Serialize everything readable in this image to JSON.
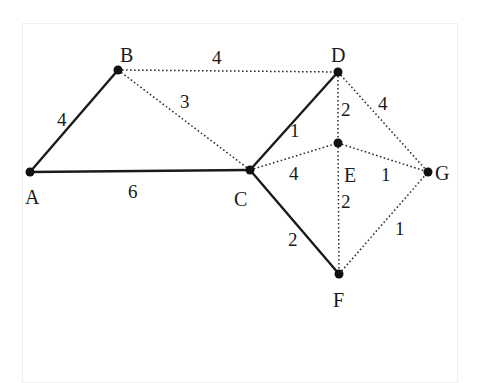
{
  "diagram": {
    "type": "weighted-undirected-graph",
    "style": {
      "background": "#ffffff",
      "frame_border": "#efefef",
      "ink": "#1a1a1a"
    },
    "nodes": [
      {
        "id": "A",
        "label": "A",
        "x": 30,
        "y": 172,
        "label_x": 25,
        "label_y": 204
      },
      {
        "id": "B",
        "label": "B",
        "x": 118,
        "y": 70,
        "label_x": 120,
        "label_y": 62
      },
      {
        "id": "C",
        "label": "C",
        "x": 250,
        "y": 170,
        "label_x": 234,
        "label_y": 206
      },
      {
        "id": "D",
        "label": "D",
        "x": 338,
        "y": 72,
        "label_x": 331,
        "label_y": 62
      },
      {
        "id": "E",
        "label": "E",
        "x": 338,
        "y": 143,
        "label_x": 344,
        "label_y": 182
      },
      {
        "id": "F",
        "label": "F",
        "x": 339,
        "y": 274,
        "label_x": 333,
        "label_y": 307
      },
      {
        "id": "G",
        "label": "G",
        "x": 428,
        "y": 172,
        "label_x": 435,
        "label_y": 180
      }
    ],
    "edges": [
      {
        "from": "A",
        "to": "B",
        "weight": "4",
        "style": "solid",
        "label_x": 57,
        "label_y": 126
      },
      {
        "from": "A",
        "to": "C",
        "weight": "6",
        "style": "solid",
        "label_x": 128,
        "label_y": 198
      },
      {
        "from": "C",
        "to": "D",
        "weight": "1",
        "style": "solid",
        "label_x": 290,
        "label_y": 137
      },
      {
        "from": "C",
        "to": "F",
        "weight": "2",
        "style": "solid",
        "label_x": 288,
        "label_y": 246
      },
      {
        "from": "B",
        "to": "D",
        "weight": "4",
        "style": "dotted",
        "label_x": 212,
        "label_y": 64
      },
      {
        "from": "B",
        "to": "C",
        "weight": "3",
        "style": "dotted",
        "label_x": 180,
        "label_y": 108
      },
      {
        "from": "D",
        "to": "E",
        "weight": "2",
        "style": "dotted",
        "label_x": 341,
        "label_y": 116
      },
      {
        "from": "D",
        "to": "G",
        "weight": "4",
        "style": "dotted",
        "label_x": 378,
        "label_y": 110
      },
      {
        "from": "C",
        "to": "E",
        "weight": "4",
        "style": "dotted",
        "label_x": 289,
        "label_y": 180
      },
      {
        "from": "E",
        "to": "G",
        "weight": "1",
        "style": "dotted",
        "label_x": 381,
        "label_y": 181
      },
      {
        "from": "E",
        "to": "F",
        "weight": "2",
        "style": "dotted",
        "label_x": 341,
        "label_y": 208
      },
      {
        "from": "F",
        "to": "G",
        "weight": "1",
        "style": "dotted",
        "label_x": 395,
        "label_y": 235
      }
    ]
  }
}
